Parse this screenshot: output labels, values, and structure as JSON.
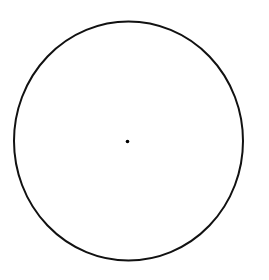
{
  "diagram": {
    "type": "circle-with-center",
    "canvas": {
      "width": 269,
      "height": 280,
      "background": "#ffffff"
    },
    "circle": {
      "cx": 128.5,
      "cy": 141,
      "rx": 114.5,
      "ry": 119.5,
      "stroke": "#111111",
      "stroke_width": 2
    },
    "center_point": {
      "cx": 127.5,
      "cy": 141.5,
      "r": 1.8,
      "fill": "#000000"
    }
  }
}
